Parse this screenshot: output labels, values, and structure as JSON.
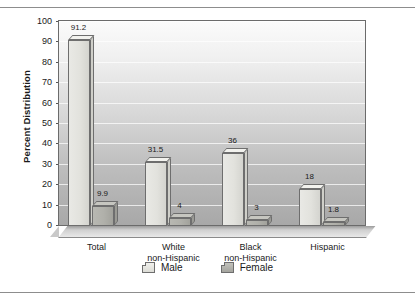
{
  "chart_data": {
    "type": "bar",
    "title": "",
    "xlabel": "",
    "ylabel": "Percent Distribution",
    "ylim": [
      0,
      100
    ],
    "ytick_step": 10,
    "grid": true,
    "legend_position": "bottom",
    "categories": [
      "Total",
      "White\nnon-Hispanic",
      "Black\nnon-Hispanic",
      "Hispanic"
    ],
    "category_lines": [
      [
        "Total"
      ],
      [
        "White",
        "non-Hispanic"
      ],
      [
        "Black",
        "non-Hispanic"
      ],
      [
        "Hispanic"
      ]
    ],
    "yticks": [
      "0",
      "10",
      "20",
      "30",
      "40",
      "50",
      "60",
      "70",
      "80",
      "90",
      "100"
    ],
    "series": [
      {
        "name": "Male",
        "color": "#e2e2dd",
        "values": [
          91.2,
          31.5,
          36,
          18
        ],
        "labels": [
          "91.2",
          "31.5",
          "36",
          "18"
        ]
      },
      {
        "name": "Female",
        "color": "#b0b0aa",
        "values": [
          9.9,
          4,
          3,
          1.8
        ],
        "labels": [
          "9.9",
          "4",
          "3",
          "1.8"
        ]
      }
    ]
  },
  "legend": {
    "items": [
      {
        "label": "Male",
        "swatch": "male-swatch"
      },
      {
        "label": "Female",
        "swatch": "female-swatch"
      }
    ]
  }
}
